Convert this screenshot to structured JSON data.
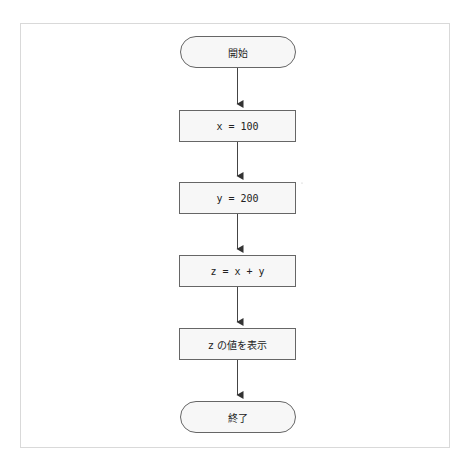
{
  "diagram": {
    "type": "flowchart",
    "colors": {
      "stroke": "#555555",
      "fill": "#f7f7f7",
      "frame": "#d9d9d9",
      "text": "#222222"
    },
    "nodes": [
      {
        "id": "start",
        "shape": "terminator",
        "label": "開始"
      },
      {
        "id": "step1",
        "shape": "process",
        "label": "x = 100"
      },
      {
        "id": "step2",
        "shape": "process",
        "label": "y = 200"
      },
      {
        "id": "step3",
        "shape": "process",
        "label": "z = x + y"
      },
      {
        "id": "step4",
        "shape": "process",
        "label": "z の値を表示"
      },
      {
        "id": "end",
        "shape": "terminator",
        "label": "終了"
      }
    ],
    "edges": [
      {
        "from": "start",
        "to": "step1"
      },
      {
        "from": "step1",
        "to": "step2"
      },
      {
        "from": "step2",
        "to": "step3"
      },
      {
        "from": "step3",
        "to": "step4"
      },
      {
        "from": "step4",
        "to": "end"
      }
    ]
  }
}
